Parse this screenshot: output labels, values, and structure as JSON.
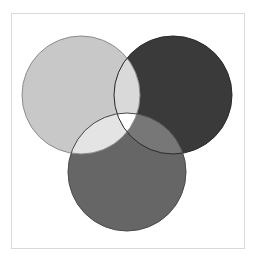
{
  "figure": {
    "title": "",
    "background_color": "#ffffff",
    "frame": {
      "x": 11,
      "y": 13,
      "width": 234,
      "height": 236,
      "border_color": "#d9d9d9",
      "fill_color": "#ffffff"
    }
  },
  "chart_data": {
    "type": "venn",
    "title": "",
    "xlabel": "",
    "ylabel": "",
    "grid": false,
    "legend": null,
    "set_count": 3,
    "blend_mode": "lighten-overlap",
    "sets": [
      {
        "id": "A",
        "label": "",
        "position": "top-left",
        "color": "#c8c8c8",
        "stroke": "#8c8c8c",
        "cx": 81,
        "cy": 95,
        "r": 59
      },
      {
        "id": "B",
        "label": "",
        "position": "top-right",
        "color": "#3a3a3a",
        "stroke": "#2a2a2a",
        "cx": 173,
        "cy": 95,
        "r": 59
      },
      {
        "id": "C",
        "label": "",
        "position": "bottom",
        "color": "#666666",
        "stroke": "#4a4a4a",
        "cx": 127,
        "cy": 172,
        "r": 59
      }
    ],
    "regions": [
      {
        "id": "A_only",
        "sets": [
          "A"
        ],
        "color": "#c8c8c8"
      },
      {
        "id": "B_only",
        "sets": [
          "B"
        ],
        "color": "#3a3a3a"
      },
      {
        "id": "C_only",
        "sets": [
          "C"
        ],
        "color": "#666666"
      },
      {
        "id": "AB",
        "sets": [
          "A",
          "B"
        ],
        "color": "#d9d9d9"
      },
      {
        "id": "AC",
        "sets": [
          "A",
          "C"
        ],
        "color": "#e4e4e4"
      },
      {
        "id": "BC",
        "sets": [
          "B",
          "C"
        ],
        "color": "#777777"
      },
      {
        "id": "ABC",
        "sets": [
          "A",
          "B",
          "C"
        ],
        "color": "#ffffff"
      }
    ],
    "stroke_width": 1
  }
}
